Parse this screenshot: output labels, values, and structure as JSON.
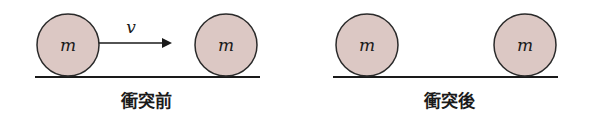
{
  "colors": {
    "ball_fill": "#dcc8c4",
    "ball_stroke": "#2a2a2a",
    "ground": "#1a1a1a",
    "arrow": "#1a1a1a"
  },
  "before": {
    "caption": "衝突前",
    "ball_left": {
      "label": "m"
    },
    "ball_right": {
      "label": "m"
    },
    "velocity_label": "v"
  },
  "after": {
    "caption": "衝突後",
    "ball_left": {
      "label": "m"
    },
    "ball_right": {
      "label": "m"
    }
  }
}
